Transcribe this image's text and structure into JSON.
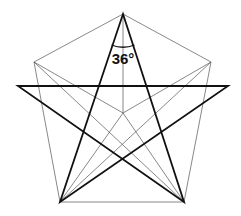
{
  "diagram": {
    "angle_label": "36°",
    "colors": {
      "background": "#ffffff",
      "thin_lines": "#555555",
      "thick_lines": "#111111"
    },
    "points": {
      "top": [
        123,
        14
      ],
      "upper_left": [
        34,
        62
      ],
      "upper_right": [
        211,
        62
      ],
      "bottom_left": [
        60,
        202
      ],
      "bottom_right": [
        184,
        202
      ],
      "center": [
        123,
        113
      ],
      "star_left": [
        18,
        86
      ],
      "star_right": [
        228,
        86
      ]
    }
  }
}
